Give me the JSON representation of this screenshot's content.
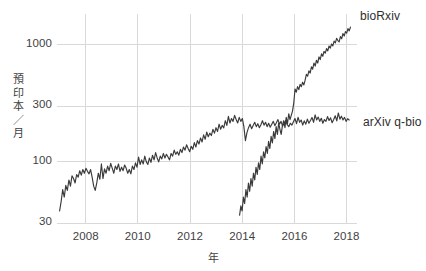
{
  "chart_data": {
    "type": "line",
    "title": "",
    "subtitle": "",
    "xlabel": "年",
    "ylabel": "預印本／月",
    "ylabel_chars": [
      "預",
      "印",
      "本",
      "／",
      "月"
    ],
    "yscale": "log",
    "xscale": "linear",
    "xlim": [
      2006.9,
      2018.4
    ],
    "ylim": [
      30,
      1700
    ],
    "grid": true,
    "legend_position": "right-inline-labels",
    "xticks": [
      2008,
      2010,
      2012,
      2014,
      2016,
      2018
    ],
    "xtick_labels": [
      "2008",
      "2010",
      "2012",
      "2014",
      "2016",
      "2018"
    ],
    "yticks": [
      30,
      100,
      300,
      1000
    ],
    "ytick_labels": [
      "30",
      "100",
      "300",
      "1000"
    ],
    "line_color": "#3a3a3a",
    "grid_color": "#d9d9d9",
    "background_color": "#ffffff",
    "text_color": "#3f3f3f",
    "series": [
      {
        "name": "arXiv q-bio",
        "label": "arXiv q-bio",
        "color": "#3a3a3a",
        "x_start": 2007.0,
        "x_end": 2018.1,
        "values": [
          38,
          46,
          58,
          50,
          63,
          57,
          70,
          62,
          76,
          72,
          66,
          78,
          74,
          84,
          77,
          86,
          80,
          88,
          83,
          79,
          86,
          74,
          62,
          57,
          66,
          80,
          71,
          96,
          72,
          87,
          80,
          92,
          84,
          97,
          88,
          80,
          92,
          86,
          96,
          83,
          90,
          84,
          94,
          88,
          80,
          86,
          79,
          92,
          86,
          98,
          90,
          110,
          95,
          104,
          96,
          112,
          100,
          95,
          108,
          99,
          114,
          104,
          120,
          108,
          100,
          112,
          106,
          118,
          108,
          116,
          110,
          104,
          118,
          112,
          126,
          116,
          122,
          114,
          128,
          120,
          134,
          126,
          140,
          130,
          122,
          136,
          128,
          146,
          134,
          152,
          142,
          160,
          148,
          170,
          156,
          180,
          164,
          176,
          168,
          190,
          176,
          196,
          182,
          210,
          190,
          205,
          195,
          225,
          205,
          245,
          215,
          235,
          222,
          250,
          230,
          215,
          240,
          222,
          235,
          200,
          152,
          178,
          196,
          210,
          192,
          205,
          218,
          200,
          212,
          196,
          208,
          225,
          206,
          218,
          200,
          214,
          198,
          210,
          222,
          204,
          216,
          230,
          210,
          222,
          202,
          214,
          226,
          208,
          200,
          214,
          206,
          220,
          235,
          212,
          240,
          218,
          228,
          206,
          224,
          210,
          232,
          214,
          226,
          240,
          218,
          252,
          228,
          242,
          222,
          236,
          214,
          230,
          222,
          244,
          226,
          238,
          216,
          230,
          248,
          224,
          262,
          232,
          246,
          228,
          240,
          222,
          234,
          228
        ],
        "approx_start_value": 38,
        "approx_end_value": 232,
        "approx_peak_value": 262
      },
      {
        "name": "bioRxiv",
        "label": "bioRxiv",
        "color": "#3a3a3a",
        "x_start": 2013.9,
        "x_end": 2018.15,
        "values": [
          35,
          42,
          38,
          50,
          44,
          58,
          50,
          66,
          56,
          72,
          62,
          80,
          70,
          90,
          78,
          98,
          86,
          112,
          96,
          122,
          108,
          135,
          118,
          150,
          130,
          165,
          145,
          182,
          158,
          200,
          172,
          215,
          190,
          172,
          205,
          225,
          196,
          240,
          212,
          258,
          230,
          250,
          272,
          320,
          420,
          395,
          440,
          415,
          460,
          440,
          480,
          455,
          500,
          560,
          540,
          600,
          575,
          650,
          620,
          700,
          660,
          740,
          700,
          790,
          750,
          840,
          800,
          880,
          850,
          930,
          890,
          980,
          940,
          1020,
          980,
          1080,
          1040,
          1140,
          1090,
          1060,
          1180,
          1130,
          1250,
          1190,
          1300,
          1260,
          1380,
          1320,
          1420
        ],
        "approx_start_value": 35,
        "approx_end_value": 1420,
        "crossover_year": 2016.0,
        "crossover_value": 240
      }
    ],
    "annotations": [
      {
        "text": "bioRxiv",
        "series": "bioRxiv",
        "position": "end-right"
      },
      {
        "text": "arXiv q-bio",
        "series": "arXiv q-bio",
        "position": "end-right"
      }
    ]
  }
}
